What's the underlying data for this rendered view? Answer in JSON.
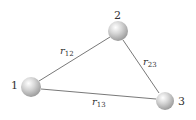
{
  "diagram": {
    "nodes": [
      {
        "id": "1",
        "label": "1",
        "cx": 31,
        "cy": 87,
        "r": 10
      },
      {
        "id": "2",
        "label": "2",
        "cx": 118,
        "cy": 31,
        "r": 10
      },
      {
        "id": "3",
        "label": "3",
        "cx": 165,
        "cy": 101,
        "r": 9
      }
    ],
    "edges": [
      {
        "from": "1",
        "to": "2",
        "label_main": "r",
        "label_sub": "12"
      },
      {
        "from": "2",
        "to": "3",
        "label_main": "r",
        "label_sub": "23"
      },
      {
        "from": "1",
        "to": "3",
        "label_main": "r",
        "label_sub": "13"
      }
    ],
    "colors": {
      "sphere": "#c8c8c8",
      "line": "#555555",
      "text": "#333333"
    }
  }
}
